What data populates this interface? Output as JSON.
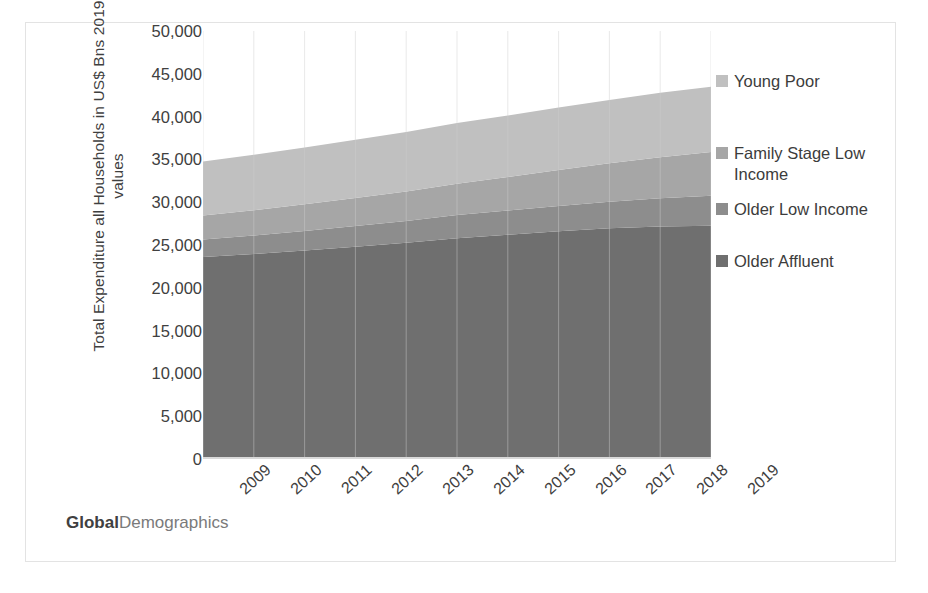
{
  "chart_data": {
    "type": "area",
    "title": "",
    "xlabel": "",
    "ylabel": "Total Expenditure all Households in US$ Bns 2019 values",
    "ylabel_lines": [
      "Total Expenditure all Households in US$ Bns",
      "2019 values"
    ],
    "categories": [
      "2009",
      "2010",
      "2011",
      "2012",
      "2013",
      "2014",
      "2015",
      "2016",
      "2017",
      "2018",
      "2019"
    ],
    "ylim": [
      0,
      50000
    ],
    "ytick_labels": [
      "50,000",
      "45,000",
      "40,000",
      "35,000",
      "30,000",
      "25,000",
      "20,000",
      "15,000",
      "10,000",
      "5,000",
      "0"
    ],
    "ytick_values": [
      50000,
      45000,
      40000,
      35000,
      30000,
      25000,
      20000,
      15000,
      10000,
      5000,
      0
    ],
    "grid": "vertical-only",
    "stacked": true,
    "legend_position": "right",
    "series": [
      {
        "name": "Older Affluent",
        "color": "#6f6f6f",
        "values": [
          23600,
          23950,
          24350,
          24800,
          25250,
          25800,
          26200,
          26600,
          26950,
          27150,
          27250
        ]
      },
      {
        "name": "Older Low Income",
        "color": "#8d8d8d",
        "values": [
          2050,
          2170,
          2300,
          2420,
          2550,
          2700,
          2830,
          2950,
          3100,
          3300,
          3500
        ]
      },
      {
        "name": "Family Stage Low Income",
        "color": "#a6a6a6",
        "values": [
          2800,
          2950,
          3100,
          3270,
          3450,
          3650,
          3900,
          4200,
          4500,
          4800,
          5100
        ]
      },
      {
        "name": "Young Poor",
        "color": "#c0c0c0",
        "values": [
          6300,
          6480,
          6650,
          6810,
          6950,
          7100,
          7200,
          7300,
          7400,
          7550,
          7650
        ]
      }
    ],
    "series_totals": [
      34750,
      35550,
      36400,
      37300,
      38200,
      39250,
      40130,
      41050,
      41950,
      42800,
      43500
    ]
  },
  "legend": {
    "items": [
      {
        "label": "Young Poor",
        "color": "#c0c0c0"
      },
      {
        "label": "Family Stage Low\nIncome",
        "color": "#a6a6a6"
      },
      {
        "label": "Older Low Income",
        "color": "#8d8d8d"
      },
      {
        "label": "Older Affluent",
        "color": "#6f6f6f"
      }
    ]
  },
  "watermark": {
    "bold_text": "Global",
    "light_text": "Demographics"
  },
  "colors": {
    "frame_border": "#e3e3e3",
    "axis_line": "#d9d9d9",
    "text": "#404040",
    "gridline": "#cfcfcf"
  }
}
